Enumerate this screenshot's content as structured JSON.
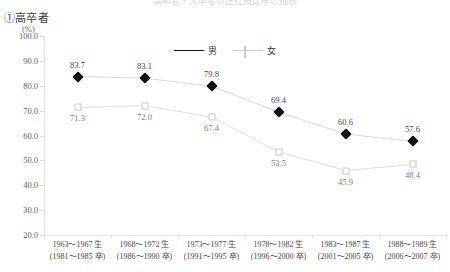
{
  "title_partial": "高卒者・大卒者の正社員比率の推移",
  "panel_heading": "①高卒者",
  "unit_label": "(%)",
  "legend": [
    {
      "label": "男",
      "marker": "filled-diamond",
      "color": "#111111"
    },
    {
      "label": "女",
      "marker": "open-square",
      "color": "#c9c9c9"
    }
  ],
  "chart_data": {
    "type": "line",
    "title": "①高卒者",
    "xlabel": "",
    "ylabel": "(%)",
    "ylim": [
      20.0,
      100.0
    ],
    "ytick_labels": [
      "100.0",
      "90.0",
      "80.0",
      "70.0",
      "60.0",
      "50.0",
      "40.0",
      "30.0",
      "20.0"
    ],
    "ytick_values": [
      100.0,
      90.0,
      80.0,
      70.0,
      60.0,
      50.0,
      40.0,
      30.0,
      20.0
    ],
    "grid": false,
    "legend_position": "top-center",
    "categories": [
      "1963〜1967 生\n(1981〜1985 卒)",
      "1968〜1972 生\n(1986〜1990 卒)",
      "1973〜1977 生\n(1991〜1995 卒)",
      "1978〜1982 生\n(1996〜2000 卒)",
      "1983〜1987 生\n(2001〜2005 卒)",
      "1988〜1989 生\n(2006〜2007 卒)"
    ],
    "categories_line1": [
      "1963〜1967 生",
      "1968〜1972 生",
      "1973〜1977 生",
      "1978〜1982 生",
      "1983〜1987 生",
      "1988〜1989 生"
    ],
    "categories_line2": [
      "(1981〜1985 卒)",
      "(1986〜1990 卒)",
      "(1991〜1995 卒)",
      "(1996〜2000 卒)",
      "(2001〜2005 卒)",
      "(2006〜2007 卒)"
    ],
    "series": [
      {
        "name": "男",
        "marker": "filled-diamond",
        "color": "#111111",
        "values": [
          83.7,
          83.1,
          79.8,
          69.4,
          60.6,
          57.6
        ],
        "labels": [
          "83.7",
          "83.1",
          "79.8",
          "69.4",
          "60.6",
          "57.6"
        ],
        "label_position": "above"
      },
      {
        "name": "女",
        "marker": "open-square",
        "color": "#c9c9c9",
        "values": [
          71.3,
          72.0,
          67.4,
          53.5,
          45.9,
          48.4
        ],
        "labels": [
          "71.3",
          "72.0",
          "67.4",
          "53.5",
          "45.9",
          "48.4"
        ],
        "label_position": "below"
      }
    ]
  }
}
